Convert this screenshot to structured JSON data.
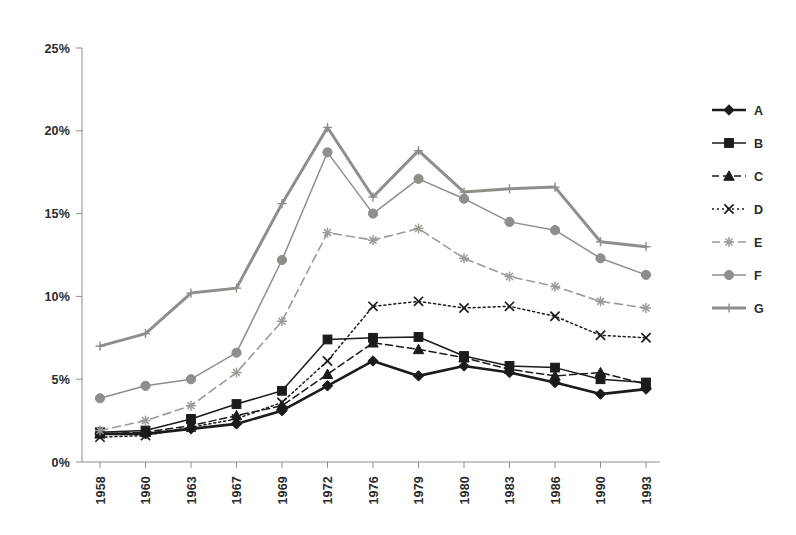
{
  "chart_data": {
    "type": "line",
    "title": "",
    "subtitle": "",
    "xlabel": "",
    "ylabel": "",
    "categories": [
      "1958",
      "1960",
      "1963",
      "1967",
      "1969",
      "1972",
      "1976",
      "1979",
      "1980",
      "1983",
      "1986",
      "1990",
      "1993"
    ],
    "ylim": [
      0,
      25
    ],
    "ytick_values": [
      0,
      5,
      10,
      15,
      20,
      25
    ],
    "ytick_labels": [
      "0%",
      "5%",
      "10%",
      "15%",
      "20%",
      "25%"
    ],
    "grid": false,
    "legend_position": "right",
    "x_tick_label_rotation": -90,
    "series": [
      {
        "name": "A",
        "values": [
          1.7,
          1.7,
          2.0,
          2.3,
          3.1,
          4.6,
          6.1,
          5.2,
          5.8,
          5.4,
          4.8,
          4.1,
          4.4
        ],
        "color": "#1b1b1b",
        "marker": "diamond",
        "dash": "none",
        "width": 2.6
      },
      {
        "name": "B",
        "values": [
          1.8,
          1.9,
          2.6,
          3.5,
          4.3,
          7.4,
          7.5,
          7.55,
          6.4,
          5.8,
          5.7,
          5.0,
          4.8
        ],
        "color": "#1b1b1b",
        "marker": "square",
        "dash": "none",
        "width": 1.5
      },
      {
        "name": "C",
        "values": [
          1.7,
          1.8,
          2.2,
          2.8,
          3.4,
          5.3,
          7.2,
          6.8,
          6.3,
          5.6,
          5.2,
          5.4,
          4.7
        ],
        "color": "#1b1b1b",
        "marker": "triangle",
        "dash": "7,4",
        "width": 1.5
      },
      {
        "name": "D",
        "values": [
          1.5,
          1.6,
          2.1,
          2.6,
          3.6,
          6.1,
          9.4,
          9.7,
          9.3,
          9.4,
          8.8,
          7.65,
          7.5
        ],
        "color": "#1b1b1b",
        "marker": "cross",
        "dash": "2,3",
        "width": 1.5
      },
      {
        "name": "E",
        "values": [
          1.9,
          2.5,
          3.4,
          5.4,
          8.5,
          13.85,
          13.4,
          14.1,
          12.3,
          11.2,
          10.6,
          9.7,
          9.3
        ],
        "color": "#9a9a96",
        "marker": "star",
        "dash": "8,5",
        "width": 1.6
      },
      {
        "name": "F",
        "values": [
          3.85,
          4.6,
          5.0,
          6.6,
          12.2,
          18.7,
          15.0,
          17.1,
          15.9,
          14.5,
          14.0,
          12.3,
          11.3
        ],
        "color": "#8e8e8a",
        "marker": "circle",
        "dash": "none",
        "width": 1.5
      },
      {
        "name": "G",
        "values": [
          7.0,
          7.75,
          10.2,
          10.5,
          15.6,
          20.2,
          16.0,
          18.8,
          16.3,
          16.5,
          16.6,
          13.3,
          13.0
        ],
        "color": "#8e8e8a",
        "marker": "plus",
        "dash": "none",
        "width": 3.0
      }
    ]
  },
  "legend": {
    "items": [
      {
        "label": "A"
      },
      {
        "label": "B"
      },
      {
        "label": "C"
      },
      {
        "label": "D"
      },
      {
        "label": "E"
      },
      {
        "label": "F"
      },
      {
        "label": "G"
      }
    ]
  },
  "colors": {
    "background": "#ffffff",
    "axis": "#8d8d8a",
    "dark_series": "#1b1b1b",
    "gray_series": "#8e8e8a",
    "light_gray_series": "#9a9a96",
    "text": "#2b2b2b"
  }
}
